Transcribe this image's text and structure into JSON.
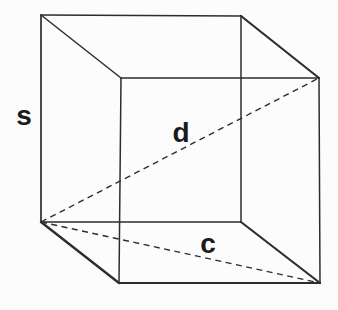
{
  "figure": {
    "width": 338,
    "height": 310,
    "background_color": "#fcfcfc",
    "stroke_color": "#2d2d2d",
    "label_color": "#1b1b1b",
    "label_font_size": 28,
    "dash_pattern": "6 4.5",
    "vertices": {
      "front_top_left": [
        41,
        15
      ],
      "front_top_right": [
        241,
        16
      ],
      "front_bottom_right": [
        241,
        222
      ],
      "front_bottom_left": [
        41,
        222
      ],
      "back_top_left": [
        121,
        78
      ],
      "back_top_right": [
        319,
        78
      ],
      "back_bottom_right": [
        320,
        283
      ],
      "back_bottom_left": [
        119,
        283
      ]
    },
    "edges": [
      {
        "name": "edge-front-top",
        "from": "front_top_left",
        "to": "front_top_right",
        "width": 1.3
      },
      {
        "name": "edge-front-right",
        "from": "front_top_right",
        "to": "front_bottom_right",
        "width": 1.5
      },
      {
        "name": "edge-front-bottom",
        "from": "front_bottom_right",
        "to": "front_bottom_left",
        "width": 1.7
      },
      {
        "name": "edge-front-left",
        "from": "front_bottom_left",
        "to": "front_top_left",
        "width": 1.7
      },
      {
        "name": "edge-back-top",
        "from": "back_top_left",
        "to": "back_top_right",
        "width": 1.3
      },
      {
        "name": "edge-back-right",
        "from": "back_top_right",
        "to": "back_bottom_right",
        "width": 1.5
      },
      {
        "name": "edge-back-bottom",
        "from": "back_bottom_right",
        "to": "back_bottom_left",
        "width": 2.0
      },
      {
        "name": "edge-back-left",
        "from": "back_bottom_left",
        "to": "back_top_left",
        "width": 1.5
      },
      {
        "name": "edge-top-left-connector",
        "from": "front_top_left",
        "to": "back_top_left",
        "width": 1.5
      },
      {
        "name": "edge-top-right-connector",
        "from": "front_top_right",
        "to": "back_top_right",
        "width": 2.2
      },
      {
        "name": "edge-bottom-right-connector",
        "from": "front_bottom_right",
        "to": "back_bottom_right",
        "width": 2.2
      },
      {
        "name": "edge-bottom-left-connector",
        "from": "front_bottom_left",
        "to": "back_bottom_left",
        "width": 2.4
      }
    ],
    "diagonals": [
      {
        "name": "space-diagonal",
        "from": "front_bottom_left",
        "to": "back_top_right",
        "width": 1.4
      },
      {
        "name": "bottom-face-diagonal",
        "from": "front_bottom_left",
        "to": "back_bottom_right",
        "width": 1.4
      }
    ],
    "labels": [
      {
        "name": "label-side-s",
        "text": "s",
        "x": 24,
        "y": 125
      },
      {
        "name": "label-diagonal-d",
        "text": "d",
        "x": 181,
        "y": 142
      },
      {
        "name": "label-diagonal-c",
        "text": "c",
        "x": 208,
        "y": 253
      }
    ]
  }
}
